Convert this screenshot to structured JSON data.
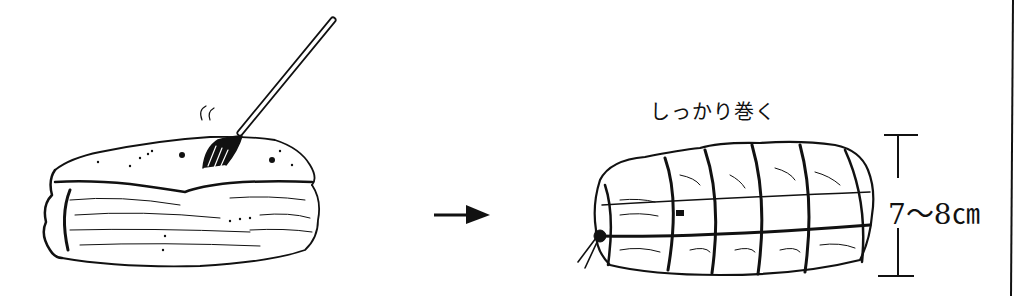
{
  "steps": [
    {
      "id": "pierce",
      "description": "meat block pierced with fork",
      "sound_marks": "〃"
    },
    {
      "id": "tie",
      "description": "meat rolled and tied with string",
      "caption": "しっかり巻く"
    }
  ],
  "arrow": "→",
  "dimension": {
    "label": "7～8㎝",
    "axis": "height"
  },
  "colors": {
    "ink": "#111111",
    "background": "#ffffff"
  }
}
